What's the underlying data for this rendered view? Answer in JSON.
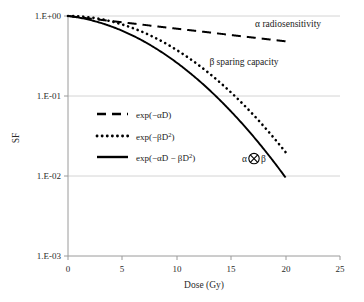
{
  "chart_data": {
    "type": "line",
    "title": "",
    "xlabel": "Dose (Gy)",
    "ylabel": "SF",
    "xlim": [
      0,
      25
    ],
    "ylim": [
      0.001,
      1
    ],
    "yscale": "log",
    "xticks": [
      "0",
      "5",
      "10",
      "15",
      "20",
      "25"
    ],
    "xtick_values": [
      0,
      5,
      10,
      15,
      20,
      25
    ],
    "yticks": [
      "1.E+00",
      "1.E-01",
      "1.E-02",
      "1.E-03"
    ],
    "ytick_values": [
      1,
      0.1,
      0.01,
      0.001
    ],
    "grid": "horizontal",
    "legend_position": "inside-left",
    "params": {
      "alpha": 0.0365,
      "beta": 0.0098
    },
    "series": [
      {
        "name": "exp(−αD)",
        "style": "dashed",
        "color": "#000000",
        "x": [
          0,
          1,
          2,
          3,
          4,
          5,
          6,
          7,
          8,
          9,
          10,
          11,
          12,
          13,
          14,
          15,
          16,
          17,
          18,
          19,
          20
        ],
        "y": [
          1.0,
          0.964,
          0.93,
          0.896,
          0.864,
          0.833,
          0.803,
          0.774,
          0.746,
          0.72,
          0.694,
          0.669,
          0.645,
          0.622,
          0.599,
          0.578,
          0.557,
          0.537,
          0.518,
          0.499,
          0.481
        ]
      },
      {
        "name": "exp(−βD²)",
        "style": "dotted",
        "color": "#000000",
        "x": [
          0,
          1,
          2,
          3,
          4,
          5,
          6,
          7,
          8,
          9,
          10,
          11,
          12,
          13,
          14,
          15,
          16,
          17,
          18,
          19,
          20
        ],
        "y": [
          1.0,
          0.99,
          0.961,
          0.916,
          0.855,
          0.783,
          0.703,
          0.619,
          0.535,
          0.453,
          0.375,
          0.305,
          0.243,
          0.19,
          0.146,
          0.11,
          0.081,
          0.059,
          0.042,
          0.029,
          0.0195
        ]
      },
      {
        "name": "exp(−αD − βD²)",
        "style": "solid",
        "color": "#000000",
        "x": [
          0,
          1,
          2,
          3,
          4,
          5,
          6,
          7,
          8,
          9,
          10,
          11,
          12,
          13,
          14,
          15,
          16,
          17,
          18,
          19,
          20
        ],
        "y": [
          1.0,
          0.954,
          0.894,
          0.821,
          0.739,
          0.652,
          0.565,
          0.479,
          0.399,
          0.326,
          0.26,
          0.204,
          0.157,
          0.118,
          0.0875,
          0.0636,
          0.0453,
          0.0316,
          0.0216,
          0.0145,
          0.0094
        ]
      }
    ],
    "annotations": [
      {
        "text": "α radiosensitivity",
        "x": 17.2,
        "y": 0.72,
        "name": "alpha-radiosensitivity-annotation"
      },
      {
        "text": "β sparing capacity",
        "x": 13.0,
        "y": 0.245,
        "name": "beta-sparing-capacity-annotation"
      }
    ],
    "symbol_annotation": {
      "left": "α",
      "operator": "⊗",
      "right": "β",
      "x": 17.1,
      "y": 0.0165,
      "name": "alpha-tensor-beta-annotation"
    },
    "legend": [
      {
        "label": "exp(−αD)",
        "style": "dashed"
      },
      {
        "label": "exp(−βD²)",
        "style": "dotted"
      },
      {
        "label": "exp(−αD − βD²)",
        "style": "solid"
      }
    ]
  }
}
